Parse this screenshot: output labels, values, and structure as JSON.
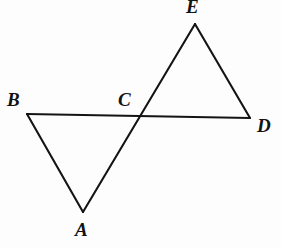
{
  "figure": {
    "kind": "geometry-diagram",
    "background_color": "#fdfdfd",
    "stroke_color": "#141414",
    "stroke_width": 2.1,
    "canvas": {
      "width": 281,
      "height": 248
    },
    "points": [
      {
        "name": "B",
        "label": "B",
        "x": 27,
        "y": 114,
        "label_x": 7,
        "label_y": 90
      },
      {
        "name": "C",
        "label": "C",
        "x": 138,
        "y": 117,
        "label_x": 118,
        "label_y": 90
      },
      {
        "name": "D",
        "label": "D",
        "x": 250,
        "y": 118,
        "label_x": 257,
        "label_y": 116
      },
      {
        "name": "E",
        "label": "E",
        "x": 195,
        "y": 24,
        "label_x": 186,
        "label_y": -3
      },
      {
        "name": "A",
        "label": "A",
        "x": 83,
        "y": 212,
        "label_x": 75,
        "label_y": 220
      }
    ],
    "segments": [
      {
        "name": "segment-BD",
        "from": "B",
        "to": "D",
        "path": "M 27 114 L 250 118"
      },
      {
        "name": "segment-BA",
        "from": "B",
        "to": "A",
        "path": "M 27 114 L 83 212"
      },
      {
        "name": "segment-AE",
        "from": "A",
        "to": "E",
        "path": "M 83 212 L 195 24"
      },
      {
        "name": "segment-ED",
        "from": "E",
        "to": "D",
        "path": "M 195 24 L 250 118"
      }
    ]
  }
}
